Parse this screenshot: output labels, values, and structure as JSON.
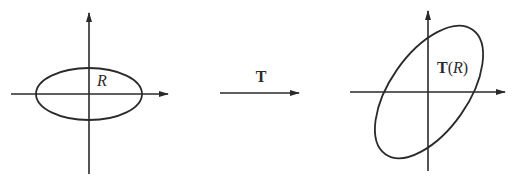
{
  "diagram": {
    "stroke_color": "#2a2a2a",
    "left": {
      "region_label": "R"
    },
    "middle": {
      "transform_label": "T"
    },
    "right": {
      "region_label_prefix": "T",
      "region_label_open": "(",
      "region_label_var": "R",
      "region_label_close": ")"
    }
  }
}
